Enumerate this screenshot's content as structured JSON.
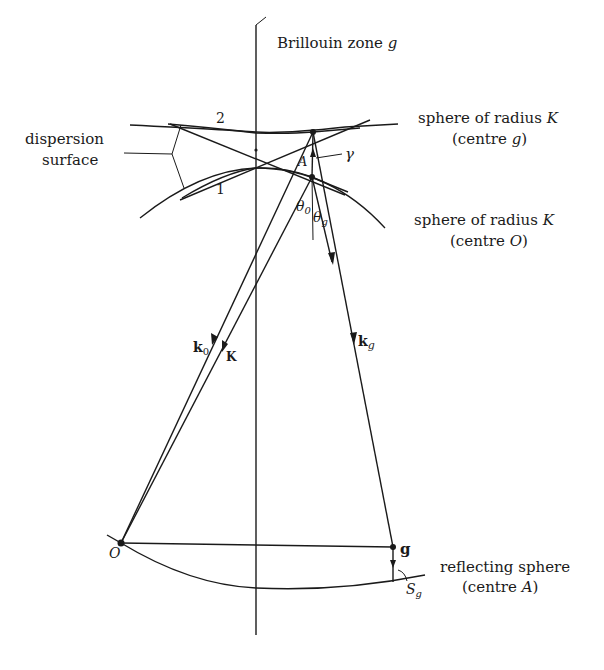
{
  "diagram": {
    "type": "reciprocal-space construction (dynamical diffraction)",
    "labels": {
      "brillouin_zone": {
        "text": "Brillouin zone ",
        "var": "g"
      },
      "dispersion_surface_line1": "dispersion",
      "dispersion_surface_line2": "surface",
      "branch_1": "1",
      "branch_2": "2",
      "sphere_g_line1": {
        "text": "sphere of radius ",
        "var": "K"
      },
      "sphere_g_line2": {
        "pre": "(centre ",
        "var": "g",
        "post": ")"
      },
      "sphere_o_line1": {
        "text": "sphere of radius ",
        "var": "K"
      },
      "sphere_o_line2": {
        "pre": "(centre ",
        "var": "O",
        "post": ")"
      },
      "point_A": "A",
      "gamma": "γ",
      "theta_0": {
        "base": "θ",
        "sub": "0"
      },
      "theta_g": {
        "base": "θ",
        "sub": "g"
      },
      "k0": {
        "base": "k",
        "sub": "0"
      },
      "K": "K",
      "kg": {
        "base": "k",
        "sub": "g"
      },
      "origin": "O",
      "g_point": "g",
      "reflecting_sphere_line1": "reflecting sphere",
      "reflecting_sphere_line2": {
        "pre": "(centre ",
        "var": "A",
        "post": ")"
      },
      "Sg": {
        "base": "S",
        "sub": "g"
      }
    },
    "points": {
      "O": [
        121,
        543
      ],
      "g": [
        393,
        547
      ],
      "A": [
        312,
        177
      ],
      "top": [
        313,
        132
      ]
    }
  }
}
